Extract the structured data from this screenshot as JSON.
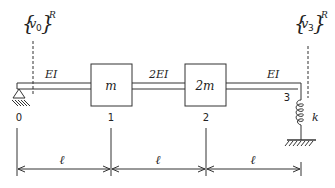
{
  "diagram": {
    "type": "beam-mass-spring system",
    "displacements": {
      "left": {
        "symbol": "v",
        "subscript": "0",
        "superscript": "R"
      },
      "right": {
        "symbol": "v",
        "subscript": "3",
        "superscript": "R"
      }
    },
    "segments": [
      {
        "label": "EI",
        "from_node": "0",
        "to_node": "1"
      },
      {
        "label": "2EI",
        "from_node": "1",
        "to_node": "2"
      },
      {
        "label": "EI",
        "from_node": "2",
        "to_node": "3"
      }
    ],
    "masses": [
      {
        "label": "m",
        "node": "1"
      },
      {
        "label": "2m",
        "node": "2"
      }
    ],
    "nodes": [
      "0",
      "1",
      "2",
      "3"
    ],
    "spring": {
      "label": "k",
      "node": "3"
    },
    "support": {
      "type": "pin",
      "node": "0"
    },
    "dimensions": [
      "ℓ",
      "ℓ",
      "ℓ"
    ]
  }
}
